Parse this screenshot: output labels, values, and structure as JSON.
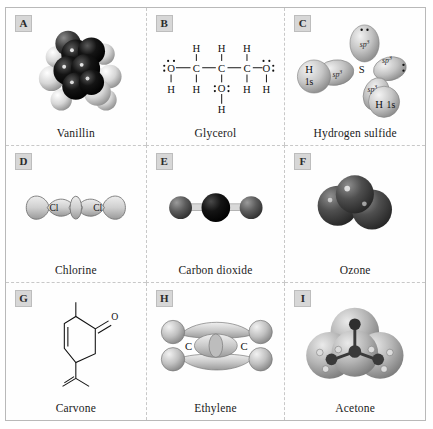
{
  "figure": {
    "rows": 3,
    "columns": 3,
    "panels": [
      {
        "letter": "A",
        "caption": "Vanillin",
        "representation": "space-filling-model",
        "atom_colors": {
          "carbon": "#0d0d0d",
          "hydrogen": "#e8e8e8",
          "oxygen": "#4a4a4a"
        }
      },
      {
        "letter": "B",
        "caption": "Glycerol",
        "representation": "lewis-structure",
        "atoms": [
          "O",
          "C",
          "C",
          "C",
          "O",
          "O",
          "H",
          "H",
          "H",
          "H",
          "H",
          "H",
          "H",
          "H"
        ],
        "formula_text": "HO-CH2-CH(OH)-CH2-OH",
        "top_hydrogens": [
          "H",
          "H",
          "H"
        ],
        "bottom_hydrogens": [
          "H",
          "H",
          "H",
          "H"
        ],
        "carbon_labels": [
          "C",
          "C",
          "C"
        ],
        "oxygen_labels": [
          "O",
          "O",
          "O"
        ],
        "hydroxyl_h": "H"
      },
      {
        "letter": "C",
        "caption": "Hydrogen sulfide",
        "representation": "hybrid-orbital-diagram",
        "center_atom": "S",
        "orbital_labels": [
          "sp3",
          "sp3",
          "sp3",
          "sp3"
        ],
        "orbital_label_text": "sp",
        "orbital_superscript": "3",
        "hydrogen_labels": [
          "H",
          "H"
        ],
        "hydrogen_orbital": "1s",
        "lone_pairs": 2
      },
      {
        "letter": "D",
        "caption": "Chlorine",
        "representation": "p-orbital-overlap",
        "atom_labels": [
          "Cl",
          "Cl"
        ],
        "bond": "sigma"
      },
      {
        "letter": "E",
        "caption": "Carbon dioxide",
        "representation": "ball-and-stick",
        "geometry": "linear",
        "atom_colors": {
          "carbon": "#141414",
          "oxygen": "#5c5c5c"
        }
      },
      {
        "letter": "F",
        "caption": "Ozone",
        "representation": "space-filling-model",
        "geometry": "bent",
        "atom_colors": {
          "oxygen": "#4d4d4d"
        }
      },
      {
        "letter": "G",
        "caption": "Carvone",
        "representation": "skeletal-structure",
        "atom_labels": [
          "O"
        ],
        "ring": "cyclohexenone",
        "substituents": [
          "methyl",
          "isopropenyl"
        ]
      },
      {
        "letter": "H",
        "caption": "Ethylene",
        "representation": "molecular-orbital-diagram",
        "atom_labels": [
          "C",
          "C"
        ],
        "bonds": [
          "sigma",
          "pi"
        ]
      },
      {
        "letter": "I",
        "caption": "Acetone",
        "representation": "electron-density-surface",
        "atom_colors": {
          "carbon": "#3a3a3a",
          "oxygen": "#2e2e2e",
          "hydrogen": "#d8d8d8"
        }
      }
    ]
  }
}
